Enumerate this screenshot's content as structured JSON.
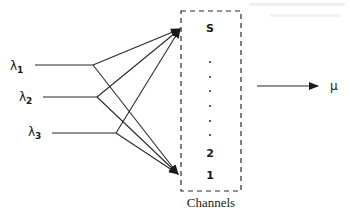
{
  "diagram": {
    "arrival_streams": [
      {
        "symbol": "λ",
        "subscript": "1"
      },
      {
        "symbol": "λ",
        "subscript": "2"
      },
      {
        "symbol": "λ",
        "subscript": "3"
      }
    ],
    "channels": {
      "top_label": "S",
      "ellipsis_count": 6,
      "lower_labels": [
        "2",
        "1"
      ],
      "caption": "Channels"
    },
    "output": {
      "label": "μ"
    }
  }
}
